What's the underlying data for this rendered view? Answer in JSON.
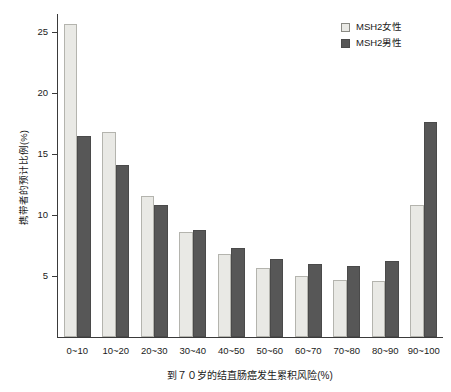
{
  "chart_data": {
    "type": "bar",
    "title": "",
    "xlabel": "到７０岁的结直肠癌发生累积风险(%)",
    "ylabel": "携带者的预计比例(%)",
    "categories": [
      "0~10",
      "10~20",
      "20~30",
      "30~40",
      "40~50",
      "50~60",
      "60~70",
      "70~80",
      "80~90",
      "90~100"
    ],
    "series": [
      {
        "name": "MSH2女性",
        "color": "#e9e9e5",
        "values": [
          25.7,
          16.8,
          11.6,
          8.6,
          6.8,
          5.7,
          5.0,
          4.7,
          4.6,
          10.8
        ]
      },
      {
        "name": "MSH2男性",
        "color": "#575757",
        "values": [
          16.5,
          14.1,
          10.8,
          8.8,
          7.3,
          6.4,
          6.0,
          5.8,
          6.2,
          17.6
        ]
      }
    ],
    "ylim": [
      0,
      26.5
    ],
    "yticks": [
      5,
      10,
      15,
      20,
      25
    ],
    "ytick_labels": [
      "5",
      "10",
      "15",
      "20",
      "25"
    ],
    "grid": false,
    "legend_position": "top-right"
  },
  "legend": {
    "items": [
      {
        "label": "MSH2女性",
        "swatch": "female"
      },
      {
        "label": "MSH2男性",
        "swatch": "male"
      }
    ]
  }
}
